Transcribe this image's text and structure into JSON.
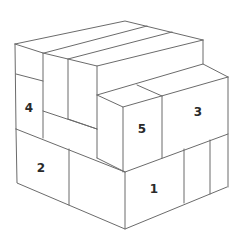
{
  "diagram": {
    "type": "isometric-cube-puzzle",
    "colors": {
      "line": "#6b6b6b",
      "fill": "#ffffff",
      "label": "#2a2a2a"
    },
    "labels": [
      {
        "id": "block-1",
        "text": "1",
        "x": 154,
        "y": 189
      },
      {
        "id": "block-2",
        "text": "2",
        "x": 41,
        "y": 168
      },
      {
        "id": "block-3",
        "text": "3",
        "x": 198,
        "y": 112
      },
      {
        "id": "block-4",
        "text": "4",
        "x": 29,
        "y": 108
      },
      {
        "id": "block-5",
        "text": "5",
        "x": 142,
        "y": 129
      }
    ]
  }
}
